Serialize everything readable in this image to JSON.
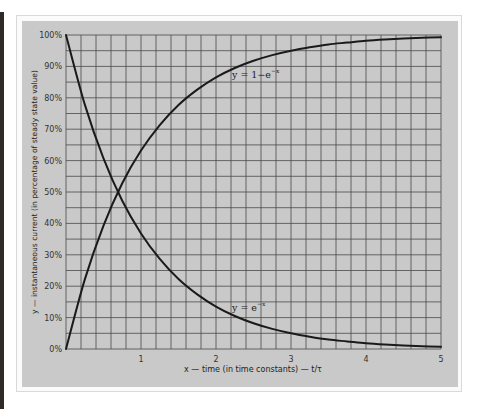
{
  "chart_data": {
    "type": "line",
    "title": "",
    "xlabel": "x — time (in time constants) — t/τ",
    "ylabel": "y — instantaneous current (in percentage of steady state value)",
    "xlim": [
      0,
      5
    ],
    "ylim": [
      0,
      100
    ],
    "x_ticks": [
      "1",
      "2",
      "3",
      "4",
      "5"
    ],
    "y_ticks": [
      "0%",
      "10%",
      "20%",
      "30%",
      "40%",
      "50%",
      "60%",
      "70%",
      "80%",
      "90%",
      "100%"
    ],
    "grid": true,
    "grid_minor_x_per_unit": 5,
    "grid_minor_y_step_percent": 5,
    "legend": "none",
    "x": [
      0,
      0.25,
      0.5,
      0.75,
      1,
      1.25,
      1.5,
      1.75,
      2,
      2.25,
      2.5,
      2.75,
      3,
      3.25,
      3.5,
      3.75,
      4,
      4.25,
      4.5,
      4.75,
      5
    ],
    "series": [
      {
        "name": "y = 1−e^(−x)",
        "label_main": "y = 1−e",
        "label_sup": "−x",
        "values": [
          0,
          22.1,
          39.3,
          52.8,
          63.2,
          71.3,
          77.7,
          82.6,
          86.5,
          89.5,
          91.8,
          93.6,
          95.0,
          96.1,
          97.0,
          97.6,
          98.2,
          98.6,
          98.9,
          99.1,
          99.3
        ]
      },
      {
        "name": "y = e^(−x)",
        "label_main": "y = e",
        "label_sup": "−x",
        "values": [
          100,
          77.9,
          60.7,
          47.2,
          36.8,
          28.7,
          22.3,
          17.4,
          13.5,
          10.5,
          8.2,
          6.4,
          5.0,
          3.9,
          3.0,
          2.4,
          1.8,
          1.4,
          1.1,
          0.9,
          0.7
        ]
      }
    ],
    "annotations": [
      {
        "text": "y = 1−e^(−x)",
        "x": 2.2,
        "y": 87
      },
      {
        "text": "y = e^(−x)",
        "x": 2.05,
        "y": 11
      }
    ]
  },
  "colors": {
    "panel": "#c9c9c9",
    "grid": "#4a4a4a",
    "curve": "#1a1a1a"
  }
}
